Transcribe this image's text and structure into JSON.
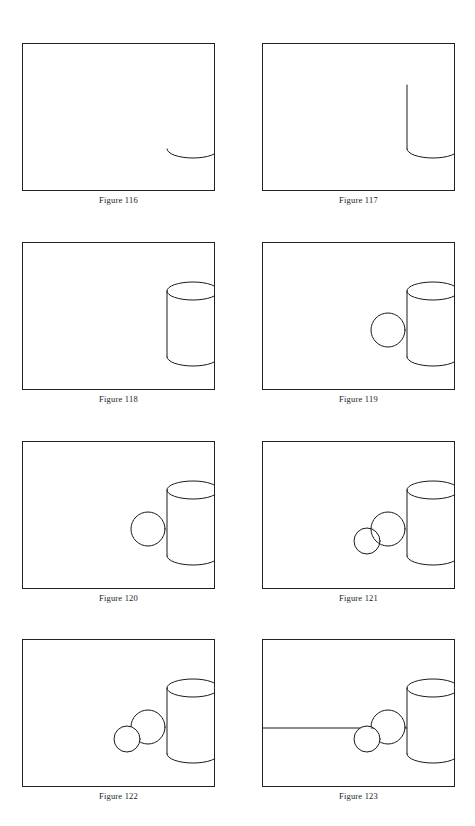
{
  "page": {
    "background_color": "#ffffff",
    "ink_color": "#1a1a1a",
    "frame_color": "#222222"
  },
  "figures": [
    {
      "id": "figure-116",
      "caption": "Figure 116",
      "description": "Empty picture frame containing a single shallow concave arc (the bottom half of an ellipse) in the lower right area — the start of the cylinder base.",
      "elements": [
        "frame",
        "base-arc"
      ]
    },
    {
      "id": "figure-117",
      "caption": "Figure 117",
      "description": "The base arc with two vertical side lines rising from its ends, forming a U shape — the cylinder body without its top ellipse.",
      "elements": [
        "frame",
        "base-arc",
        "left-side-line",
        "right-side-line"
      ]
    },
    {
      "id": "figure-118",
      "caption": "Figure 118",
      "description": "Completed cylinder: top ellipse closed, two vertical sides, bottom arc.",
      "elements": [
        "frame",
        "cylinder"
      ]
    },
    {
      "id": "figure-119",
      "caption": "Figure 119",
      "description": "A full construction circle (sphere) drawn overlapping the lower left of the cylinder; overlapping lines still visible.",
      "elements": [
        "frame",
        "cylinder",
        "large-sphere-construction"
      ]
    },
    {
      "id": "figure-120",
      "caption": "Figure 120",
      "description": "Same sphere with hidden lines erased, so the sphere reads as sitting in front of the cylinder.",
      "elements": [
        "frame",
        "cylinder",
        "large-sphere"
      ]
    },
    {
      "id": "figure-121",
      "caption": "Figure 121",
      "description": "A second, smaller construction circle added to the lower left, overlapping the first sphere; overlapping lines still visible.",
      "elements": [
        "frame",
        "cylinder",
        "large-sphere",
        "small-sphere-construction"
      ]
    },
    {
      "id": "figure-122",
      "caption": "Figure 122",
      "description": "Hidden lines erased on the small sphere; three solids now overlap cleanly front to back.",
      "elements": [
        "frame",
        "cylinder",
        "large-sphere",
        "small-sphere"
      ]
    },
    {
      "id": "figure-123",
      "caption": "Figure 123",
      "description": "A horizontal ground / table line added across the frame behind the group, completing the still life.",
      "elements": [
        "frame",
        "horizon-line",
        "cylinder",
        "large-sphere",
        "small-sphere"
      ]
    }
  ],
  "geometry": {
    "frame": {
      "width": 193,
      "height": 148,
      "stroke": 1
    },
    "cylinder": {
      "center_x": 171,
      "top_ellipse_cy": 49,
      "rx": 26,
      "ry": 9,
      "bottom_ellipse_cy": 115,
      "body_height": 66
    },
    "large_sphere": {
      "cx": 126,
      "cy": 88,
      "r": 17
    },
    "small_sphere": {
      "cx": 105,
      "cy": 100,
      "r": 13
    },
    "horizon_line_y": 89
  }
}
